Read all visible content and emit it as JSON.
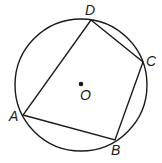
{
  "diagram": {
    "type": "inscribed quadrilateral in circle",
    "stroke_color": "#1a1a1a",
    "circle": {
      "center_label": "O",
      "cx": 81,
      "cy": 85,
      "r": 66
    },
    "points": [
      {
        "label": "A",
        "x": 23,
        "y": 115
      },
      {
        "label": "B",
        "x": 115,
        "y": 140
      },
      {
        "label": "C",
        "x": 143,
        "y": 62
      },
      {
        "label": "D",
        "x": 91,
        "y": 20
      }
    ],
    "segments": [
      "AB",
      "BC",
      "CD",
      "DA"
    ],
    "labels": {
      "A": "A",
      "B": "B",
      "C": "C",
      "D": "D",
      "O": "O"
    }
  }
}
